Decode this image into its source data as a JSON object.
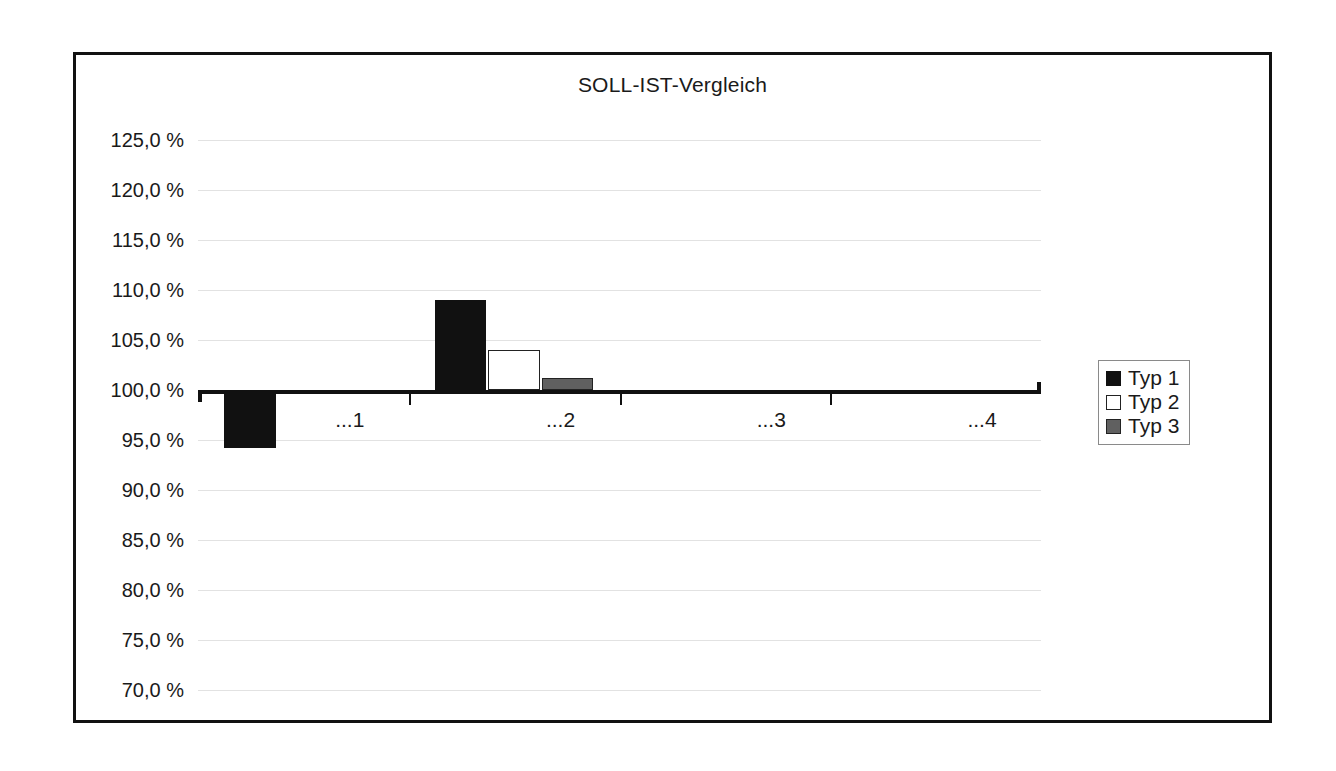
{
  "chart_data": {
    "type": "bar",
    "title": "SOLL-IST-Vergleich",
    "xlabel": "",
    "ylabel": "",
    "categories": [
      "...1",
      "...2",
      "...3",
      "...4"
    ],
    "series": [
      {
        "name": "Typ 1",
        "color": "#111111",
        "values": [
          94.2,
          109.0,
          null,
          null
        ]
      },
      {
        "name": "Typ 2",
        "color": "#ffffff",
        "values": [
          null,
          104.0,
          null,
          null
        ]
      },
      {
        "name": "Typ 3",
        "color": "#606060",
        "values": [
          null,
          101.2,
          null,
          null
        ]
      }
    ],
    "ylim": [
      70.0,
      125.0
    ],
    "ytick_step": 5.0,
    "ytick_labels": [
      "125,0 %",
      "120,0 %",
      "115,0 %",
      "110,0 %",
      "105,0 %",
      "100,0 %",
      "95,0 %",
      "90,0 %",
      "85,0 %",
      "80,0 %",
      "75,0 %",
      "70,0 %"
    ],
    "ytick_values": [
      125.0,
      120.0,
      115.0,
      110.0,
      105.0,
      100.0,
      95.0,
      90.0,
      85.0,
      80.0,
      75.0,
      70.0
    ],
    "baseline": 100.0,
    "grid": true,
    "legend_position": "right",
    "legend_entries": [
      "Typ 1",
      "Typ 2",
      "Typ 3"
    ]
  }
}
